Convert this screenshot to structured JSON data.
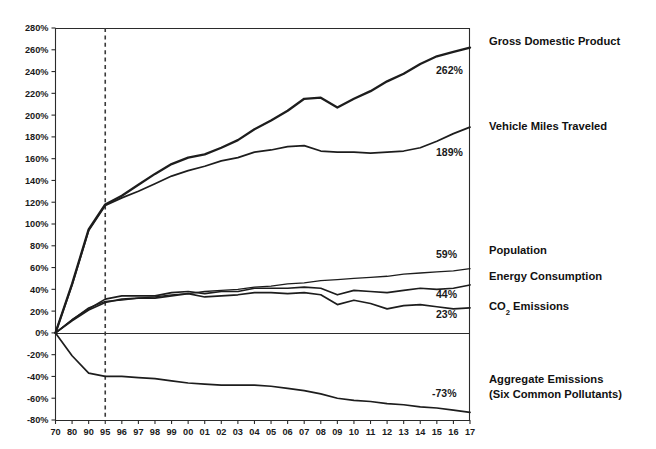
{
  "chart_data": {
    "type": "line",
    "title": "",
    "xlabel": "",
    "ylabel": "",
    "grid": false,
    "legend_position": "right-inline",
    "ylim": [
      -80,
      280
    ],
    "ytick_step": 20,
    "ytick_labels": [
      "280%",
      "260%",
      "240%",
      "220%",
      "200%",
      "180%",
      "160%",
      "140%",
      "120%",
      "100%",
      "80%",
      "60%",
      "40%",
      "20%",
      "0%",
      "-20%",
      "-40%",
      "-60%",
      "-80%"
    ],
    "ytick_values": [
      280,
      260,
      240,
      220,
      200,
      180,
      160,
      140,
      120,
      100,
      80,
      60,
      40,
      20,
      0,
      -20,
      -40,
      -60,
      -80
    ],
    "categories": [
      "70",
      "80",
      "90",
      "95",
      "96",
      "97",
      "98",
      "99",
      "00",
      "01",
      "02",
      "03",
      "04",
      "05",
      "06",
      "07",
      "08",
      "09",
      "10",
      "11",
      "12",
      "13",
      "14",
      "15",
      "16",
      "17"
    ],
    "annotations": [
      {
        "name": "reference-year-line",
        "type": "vertical-dashed",
        "at_category": "95"
      }
    ],
    "series": [
      {
        "name": "Gross Domestic Product",
        "end_label": "262%",
        "weight": "thick",
        "values": [
          0,
          45,
          95,
          118,
          126,
          136,
          146,
          155,
          161,
          164,
          170,
          177,
          187,
          195,
          204,
          215,
          216,
          207,
          215,
          222,
          231,
          238,
          247,
          254,
          258,
          262
        ]
      },
      {
        "name": "Vehicle Miles Traveled",
        "end_label": "189%",
        "weight": "med",
        "values": [
          0,
          44,
          94,
          117,
          124,
          130,
          137,
          144,
          149,
          153,
          158,
          161,
          166,
          168,
          171,
          172,
          167,
          166,
          166,
          165,
          166,
          167,
          170,
          176,
          183,
          189
        ]
      },
      {
        "name": "Population",
        "end_label": "59%",
        "weight": "thin",
        "values": [
          0,
          12,
          23,
          29,
          30,
          32,
          33,
          35,
          36,
          38,
          39,
          40,
          42,
          43,
          45,
          46,
          48,
          49,
          50,
          51,
          52,
          54,
          55,
          56,
          57,
          59
        ]
      },
      {
        "name": "Energy Consumption",
        "end_label": "44%",
        "weight": "med",
        "values": [
          0,
          12,
          22,
          31,
          34,
          34,
          34,
          37,
          38,
          36,
          38,
          38,
          41,
          41,
          41,
          42,
          41,
          35,
          39,
          38,
          37,
          39,
          41,
          40,
          41,
          44
        ]
      },
      {
        "name": "CO2 Emissions",
        "end_label": "23%",
        "weight": "med",
        "values": [
          0,
          11,
          21,
          28,
          31,
          32,
          32,
          34,
          36,
          33,
          34,
          35,
          37,
          37,
          36,
          37,
          35,
          26,
          30,
          27,
          22,
          25,
          26,
          24,
          22,
          23
        ]
      },
      {
        "name": "Aggregate Emissions (Six Common Pollutants)",
        "end_label": "-73%",
        "weight": "med",
        "values": [
          0,
          -21,
          -37,
          -40,
          -40,
          -41,
          -42,
          -44,
          -46,
          -47,
          -48,
          -48,
          -48,
          -49,
          -51,
          -53,
          -56,
          -60,
          -62,
          -63,
          -65,
          -66,
          -68,
          -69,
          -71,
          -73
        ]
      }
    ]
  },
  "labels": {
    "gdp": "Gross Domestic Product",
    "vmt": "Vehicle Miles Traveled",
    "population": "Population",
    "energy": "Energy Consumption",
    "co2_prefix": "CO",
    "co2_sub": "2",
    "co2_suffix": " Emissions",
    "aggregate_line1": "Aggregate Emissions",
    "aggregate_line2": "(Six Common Pollutants)"
  },
  "value_labels": {
    "gdp": "262%",
    "vmt": "189%",
    "population": "59%",
    "energy": "44%",
    "co2": "23%",
    "aggregate": "-73%"
  },
  "colors": {
    "line": "#1d1d1d",
    "axis": "#2b2b2b",
    "text": "#1a1a1a",
    "background": "#ffffff"
  }
}
